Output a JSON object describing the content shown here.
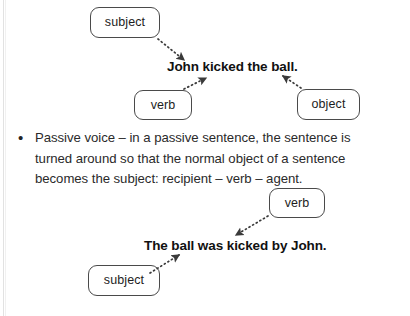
{
  "page": {
    "background_color": "#ffffff",
    "text_color": "#2a2a2a",
    "box_border_color": "#4a4a4a",
    "arrow_color": "#3a3a3a"
  },
  "active_diagram": {
    "sentence": "John kicked the ball.",
    "labels": {
      "subject": "subject",
      "verb": "verb",
      "object": "object"
    }
  },
  "bullet": {
    "marker": "•",
    "text": "Passive voice – in a passive sentence, the sentence is turned around so that the normal object of a sentence becomes the subject: recipient – verb – agent."
  },
  "passive_diagram": {
    "sentence": "The ball was kicked by John.",
    "labels": {
      "verb": "verb",
      "subject": "subject"
    }
  }
}
